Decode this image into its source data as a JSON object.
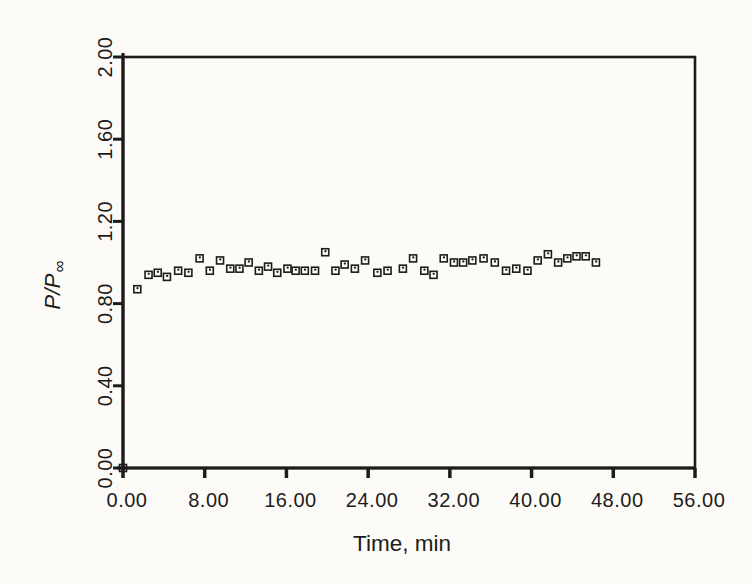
{
  "figure": {
    "background": "#fcfbf8",
    "ink": "#1d1c1a"
  },
  "chart_data": {
    "type": "scatter",
    "title": "",
    "xlabel": "Time, min",
    "ylabel": "P/P∞",
    "ylabel_main": "P/P",
    "ylabel_subscript": "∞",
    "xlim": [
      0,
      56
    ],
    "ylim": [
      0.0,
      2.0
    ],
    "x_tick_values": [
      0,
      8,
      16,
      24,
      32,
      40,
      48,
      56
    ],
    "x_tick_labels": [
      "0.00",
      "8.00",
      "16.00",
      "24.00",
      "32.00",
      "40.00",
      "48.00",
      "56.00"
    ],
    "y_tick_values": [
      0.0,
      0.4,
      0.8,
      1.2,
      1.6,
      2.0
    ],
    "y_tick_labels": [
      "0.00",
      "0.40",
      "0.80",
      "1.20",
      "1.60",
      "2.00"
    ],
    "y_tick_labels_rotated": true,
    "grid": false,
    "legend": null,
    "marker": "open-square-with-center-dot",
    "points": [
      [
        0.0,
        0.0
      ],
      [
        1.4,
        0.87
      ],
      [
        2.5,
        0.94
      ],
      [
        3.4,
        0.95
      ],
      [
        4.3,
        0.93
      ],
      [
        5.4,
        0.96
      ],
      [
        6.4,
        0.95
      ],
      [
        7.5,
        1.02
      ],
      [
        8.5,
        0.96
      ],
      [
        9.5,
        1.01
      ],
      [
        10.5,
        0.97
      ],
      [
        11.4,
        0.97
      ],
      [
        12.3,
        1.0
      ],
      [
        13.3,
        0.96
      ],
      [
        14.2,
        0.98
      ],
      [
        15.1,
        0.95
      ],
      [
        16.1,
        0.97
      ],
      [
        16.9,
        0.96
      ],
      [
        17.8,
        0.96
      ],
      [
        18.8,
        0.96
      ],
      [
        19.8,
        1.05
      ],
      [
        20.8,
        0.96
      ],
      [
        21.7,
        0.99
      ],
      [
        22.7,
        0.97
      ],
      [
        23.7,
        1.01
      ],
      [
        24.9,
        0.95
      ],
      [
        25.9,
        0.96
      ],
      [
        27.4,
        0.97
      ],
      [
        28.4,
        1.02
      ],
      [
        29.5,
        0.96
      ],
      [
        30.4,
        0.94
      ],
      [
        31.4,
        1.02
      ],
      [
        32.4,
        1.0
      ],
      [
        33.3,
        1.0
      ],
      [
        34.2,
        1.01
      ],
      [
        35.3,
        1.02
      ],
      [
        36.4,
        1.0
      ],
      [
        37.5,
        0.96
      ],
      [
        38.5,
        0.97
      ],
      [
        39.6,
        0.96
      ],
      [
        40.6,
        1.01
      ],
      [
        41.6,
        1.04
      ],
      [
        42.6,
        1.0
      ],
      [
        43.5,
        1.02
      ],
      [
        44.4,
        1.03
      ],
      [
        45.3,
        1.03
      ],
      [
        46.3,
        1.0
      ]
    ]
  }
}
